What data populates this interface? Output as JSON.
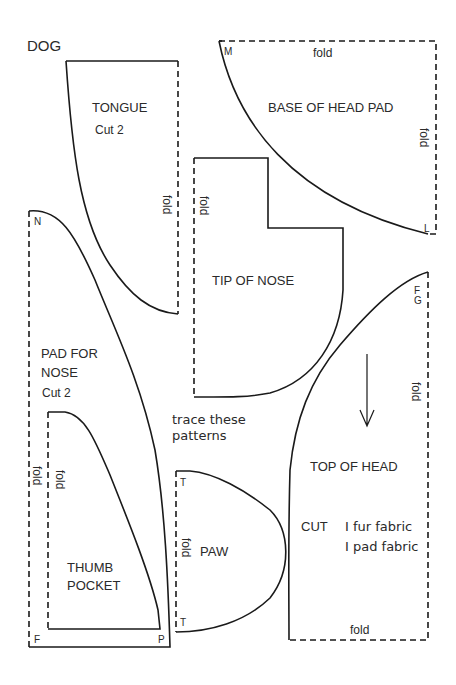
{
  "title": "DOG",
  "note": [
    "trace these",
    "patterns"
  ],
  "colors": {
    "ink": "#1a1a1a",
    "paper": "#ffffff"
  },
  "pieces": {
    "tongue": {
      "name": "TONGUE",
      "cut": "Cut 2",
      "fold": "fold"
    },
    "base_of_head_pad": {
      "name": "BASE OF HEAD PAD",
      "fold_top": "fold",
      "fold_right": "fold",
      "mark_tl": "M",
      "mark_br": "L"
    },
    "tip_of_nose": {
      "name": "TIP OF NOSE",
      "fold": "fold"
    },
    "pad_for_nose": {
      "name_line1": "PAD FOR",
      "name_line2": "NOSE",
      "cut": "Cut 2",
      "fold": "fold",
      "mark_top": "N",
      "mark_bl": "F",
      "mark_br": "P"
    },
    "thumb_pocket": {
      "name_line1": "THUMB",
      "name_line2": "POCKET",
      "fold": "fold"
    },
    "paw": {
      "name": "PAW",
      "fold": "fold",
      "mark_top": "T",
      "mark_bottom": "T"
    },
    "top_of_head": {
      "name": "TOP OF HEAD",
      "cut_label": "CUT",
      "cut_line1": "I fur fabric",
      "cut_line2": "I pad fabric",
      "fold_right": "fold",
      "fold_bottom": "fold",
      "mark_top": "F",
      "mark_top2": "G"
    }
  }
}
